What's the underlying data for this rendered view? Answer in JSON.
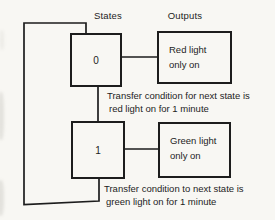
{
  "colors": {
    "background": "#f8f7f3",
    "ink": "#1d1d1d"
  },
  "diagram": {
    "column_labels": {
      "states": "States",
      "outputs": "Outputs"
    },
    "states": [
      {
        "id": "0",
        "output": {
          "line1": "Red light",
          "line2": "only on"
        },
        "transition": {
          "line1": "Transfer condition for next state is",
          "line2": "red light on for 1 minute"
        }
      },
      {
        "id": "1",
        "output": {
          "line1": "Green light",
          "line2": "only on"
        },
        "transition": {
          "line1": "Transfer condition to next state is",
          "line2": "green light on for 1 minute"
        }
      }
    ]
  }
}
